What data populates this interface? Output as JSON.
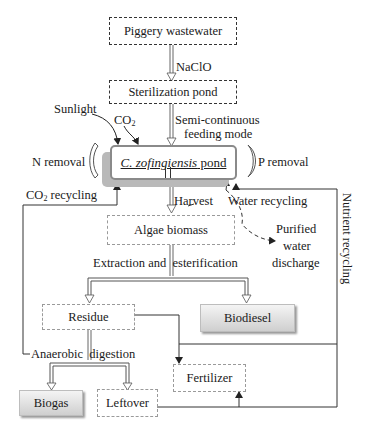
{
  "nodes": {
    "piggery_wastewater": "Piggery wastewater",
    "sterilization_pond": "Sterilization pond",
    "pond_species": "C. zofingiensis",
    "pond_suffix": " pond",
    "algae_biomass": "Algae biomass",
    "residue": "Residue",
    "biodiesel": "Biodiesel",
    "fertilizer": "Fertilizer",
    "biogas": "Biogas",
    "leftover": "Leftover"
  },
  "labels": {
    "naclo": "NaClO",
    "semi_continuous_1": "Semi-continuous",
    "semi_continuous_2": "feeding mode",
    "sunlight": "Sunlight",
    "co2_main": "CO",
    "co2_sub": "2",
    "n_removal": "N removal",
    "p_removal": "P removal",
    "co2_recycling_main": "CO",
    "co2_recycling_sub": "2",
    "co2_recycling_rest": " recycling",
    "harvest": "Harvest",
    "water_recycling": "Water recycling",
    "purified_1": "Purified",
    "purified_2": "water",
    "purified_3": "discharge",
    "extraction": "Extraction and  esterification",
    "anaerobic": "Anaerobic  digestion",
    "nutrient_recycling": "Nutrient recycling"
  },
  "colors": {
    "line": "#333333",
    "dashed_light": "#9a9a9a",
    "pond_border": "#8a8a8a",
    "pond_shadow": "#b9b9b9"
  }
}
